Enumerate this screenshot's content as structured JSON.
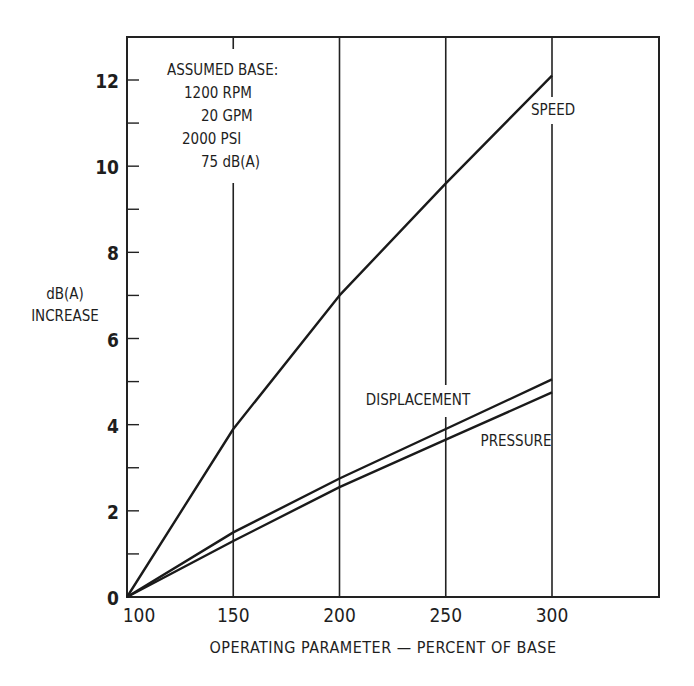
{
  "chart_data": {
    "type": "line",
    "title": "",
    "xlabel": "OPERATING PARAMETER — PERCENT OF BASE",
    "ylabel": "dB(A) INCREASE",
    "ylabel_lines": [
      "dB(A)",
      "INCREASE"
    ],
    "xlim": [
      100,
      350
    ],
    "ylim": [
      0,
      12.9
    ],
    "x_ticks": [
      100,
      150,
      200,
      250,
      300
    ],
    "x_tick_labels": [
      "100",
      "150",
      "200",
      "250",
      "300"
    ],
    "y_ticks": [
      0,
      2,
      4,
      6,
      8,
      10,
      12
    ],
    "y_tick_labels": [
      "0",
      "2",
      "4",
      "6",
      "8",
      "10",
      "12"
    ],
    "y_minor_ticks": [
      1,
      3,
      5,
      7,
      9,
      11
    ],
    "grid": "vertical lines at 150, 200, 250, 300",
    "x": [
      100,
      150,
      200,
      250,
      300
    ],
    "series": [
      {
        "name": "SPEED",
        "values": [
          0,
          3.9,
          7.0,
          9.6,
          12.1
        ]
      },
      {
        "name": "DISPLACEMENT",
        "values": [
          0,
          1.5,
          2.75,
          3.9,
          5.05
        ]
      },
      {
        "name": "PRESSURE",
        "values": [
          0,
          1.3,
          2.55,
          3.65,
          4.75
        ]
      }
    ],
    "annotations": {
      "box_title": "ASSUMED BASE:",
      "box_lines": [
        "1200 RPM",
        "20 GPM",
        "2000 PSI",
        "75 dB(A)"
      ]
    }
  }
}
